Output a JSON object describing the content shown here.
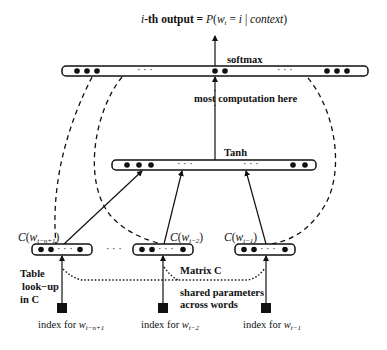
{
  "title": {
    "prefix_italic": "i",
    "prefix": "-th output = ",
    "formula_P": "P",
    "formula_open": "(",
    "formula_w": "w",
    "formula_w_sub": "t",
    "formula_eq": " = ",
    "formula_i": "i",
    "formula_bar": " | ",
    "formula_context": "context",
    "formula_close": ")"
  },
  "layers": {
    "softmax": {
      "label": "softmax",
      "ellipsis": "· · ·"
    },
    "hidden": {
      "label": "most computation here",
      "activation": "Tanh",
      "ellipsis": "· · ·"
    },
    "embedding_ellipsis": "· · ·"
  },
  "embeddings": [
    {
      "label_C": "C",
      "label_w": "w",
      "label_sub": "t−n+1",
      "dots": "· · ·"
    },
    {
      "label_C": "C",
      "label_w": "w",
      "label_sub": "t−2",
      "dots": "· · ·"
    },
    {
      "label_C": "C",
      "label_w": "w",
      "label_sub": "t−1",
      "dots": "· · ·"
    }
  ],
  "annotations": {
    "table_lookup": [
      "Table",
      "look−up",
      "in C"
    ],
    "matrix": "Matrix C",
    "shared": [
      "shared parameters",
      "across words"
    ]
  },
  "indices": [
    {
      "prefix": "index for ",
      "w": "w",
      "sub": "t−n+1"
    },
    {
      "prefix": "index for ",
      "w": "w",
      "sub": "t−2"
    },
    {
      "prefix": "index for ",
      "w": "w",
      "sub": "t−1"
    }
  ],
  "colors": {
    "ink": "#111111",
    "background": "#ffffff"
  }
}
